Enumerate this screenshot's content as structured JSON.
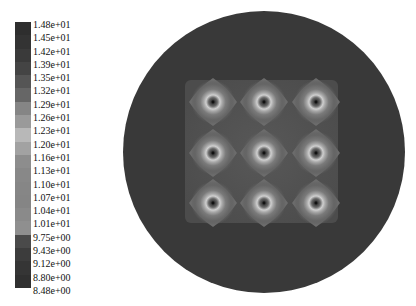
{
  "chart_data": {
    "type": "heatmap",
    "title": "",
    "colorbar": {
      "labels": [
        "1.48e+01",
        "1.45e+01",
        "1.42e+01",
        "1.39e+01",
        "1.35e+01",
        "1.32e+01",
        "1.29e+01",
        "1.26e+01",
        "1.23e+01",
        "1.20e+01",
        "1.16e+01",
        "1.13e+01",
        "1.10e+01",
        "1.07e+01",
        "1.04e+01",
        "1.01e+01",
        "9.75e+00",
        "9.43e+00",
        "9.12e+00",
        "8.80e+00",
        "8.48e+00"
      ],
      "range": [
        8.48,
        14.8
      ],
      "colors": [
        "#2e2e2e",
        "#333333",
        "#3a3a3a",
        "#444444",
        "#555555",
        "#666666",
        "#858585",
        "#9a9a9a",
        "#b8b8b8",
        "#a2a2a2",
        "#8d8d8d",
        "#888888",
        "#868686",
        "#858585",
        "#8a8a8a",
        "#8f8f8f",
        "#4a4a4a",
        "#3c3c3c",
        "#353535",
        "#303030"
      ]
    },
    "domain": {
      "shape": "circle",
      "cx": 264,
      "cy": 152,
      "r": 141,
      "fill": "#3a3a3a"
    },
    "inner_region": {
      "shape": "square",
      "x": 185,
      "y": 80,
      "w": 153,
      "h": 143,
      "fill": "#525252"
    },
    "hotspots": {
      "rows": 3,
      "cols": 3,
      "x": [
        213,
        264,
        316
      ],
      "y": [
        102,
        153,
        203
      ],
      "ring_color": "#c4c4c4",
      "halo_color": "#6e6e6e",
      "core_color": "#2a2a2a"
    }
  }
}
